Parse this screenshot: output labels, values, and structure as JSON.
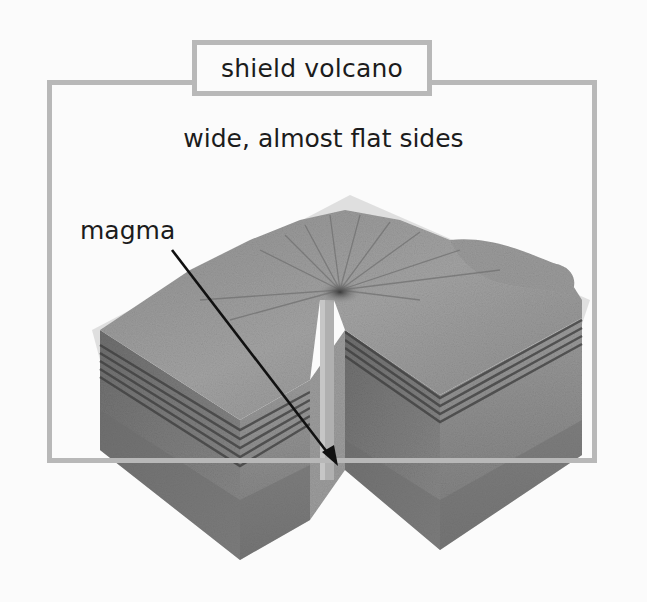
{
  "diagram": {
    "title": "shield volcano",
    "subtitle": "wide, almost flat sides",
    "labels": [
      {
        "id": "magma",
        "text": "magma"
      }
    ],
    "colors": {
      "frame": "#b8b8b8",
      "text": "#1c1c1c",
      "background": "#fbfbfb"
    }
  }
}
